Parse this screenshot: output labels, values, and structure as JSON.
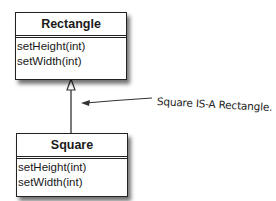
{
  "diagram": {
    "classes": [
      {
        "name": "Rectangle",
        "methods": [
          "setHeight(int)",
          "setWidth(int)"
        ]
      },
      {
        "name": "Square",
        "methods": [
          "setHeight(int)",
          "setWidth(int)"
        ]
      }
    ],
    "relationship": "inheritance",
    "annotation": "Square IS-A Rectangle.",
    "colors": {
      "line": "#222222",
      "background": "#ffffff"
    }
  }
}
